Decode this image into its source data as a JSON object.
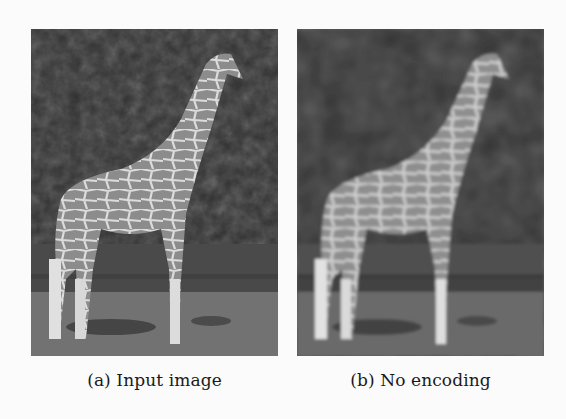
{
  "figure": {
    "subfigures": [
      {
        "label": "(a)",
        "caption": "(a) Input image",
        "image_description": "Grayscale photo of a giraffe standing on grass in front of dark trees",
        "icon": "giraffe-photo"
      },
      {
        "label": "(b)",
        "caption": "(b) No encoding",
        "image_description": "Blurred/reconstructed grayscale version of the same giraffe photo",
        "icon": "giraffe-photo-reconstructed"
      }
    ]
  },
  "colors": {
    "background": "#fbfbfb",
    "trees": "#2e2e2e",
    "grass": "#6e6e6e",
    "giraffe_patch": "#8a8a8a",
    "giraffe_lines": "#d8d8d8",
    "shadow": "#3c3c3c"
  }
}
